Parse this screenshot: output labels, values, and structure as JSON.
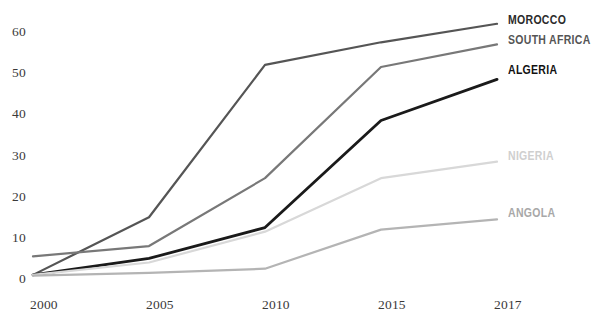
{
  "chart_data": {
    "type": "line",
    "title": "",
    "xlabel": "",
    "ylabel": "",
    "x": [
      "2000",
      "2005",
      "2010",
      "2015",
      "2017"
    ],
    "categories": [
      "2000",
      "2005",
      "2010",
      "2015",
      "2017"
    ],
    "xtick_labels": [
      "2000",
      "2005",
      "2010",
      "2015",
      "2017"
    ],
    "ytick_labels": [
      "0",
      "10",
      "20",
      "30",
      "40",
      "50",
      "60"
    ],
    "ylim": [
      0,
      65
    ],
    "yticks": [
      0,
      10,
      20,
      30,
      40,
      50,
      60
    ],
    "grid": false,
    "legend_position": "right-inline-end-of-line",
    "series": [
      {
        "name": "MOROCCO",
        "values": [
          1,
          15,
          52,
          57.5,
          62
        ],
        "color": "#555555",
        "width": 2.2,
        "label_color": "#2b2b2b"
      },
      {
        "name": "SOUTH AFRICA",
        "values": [
          5.5,
          8,
          24.5,
          51.5,
          57
        ],
        "color": "#787878",
        "width": 2.2,
        "label_color": "#555555"
      },
      {
        "name": "ALGERIA",
        "values": [
          1,
          5,
          12.5,
          38.5,
          48.5
        ],
        "color": "#1a1a1a",
        "width": 2.8,
        "label_color": "#111111"
      },
      {
        "name": "NIGERIA",
        "values": [
          1,
          4,
          11.5,
          24.5,
          28.5
        ],
        "color": "#d8d8d8",
        "width": 2.2,
        "label_color": "#cfcfcf"
      },
      {
        "name": "ANGOLA",
        "values": [
          0.8,
          1.5,
          2.5,
          12,
          14.5
        ],
        "color": "#b4b4b4",
        "width": 2.2,
        "label_color": "#a8a8a8"
      }
    ]
  },
  "axes": {
    "y_ticks": [
      {
        "label": "60",
        "value": 60
      },
      {
        "label": "50",
        "value": 50
      },
      {
        "label": "40",
        "value": 40
      },
      {
        "label": "30",
        "value": 30
      },
      {
        "label": "20",
        "value": 20
      },
      {
        "label": "10",
        "value": 10
      },
      {
        "label": "0",
        "value": 0
      }
    ],
    "x_ticks": [
      {
        "label": "2000",
        "value": 0
      },
      {
        "label": "2005",
        "value": 1
      },
      {
        "label": "2010",
        "value": 2
      },
      {
        "label": "2015",
        "value": 3
      },
      {
        "label": "2017",
        "value": 4
      }
    ]
  },
  "background": "#ffffff"
}
